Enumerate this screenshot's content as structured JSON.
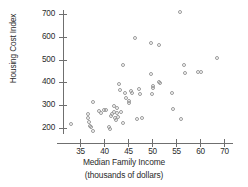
{
  "chart_data": {
    "type": "scatter",
    "title": "",
    "xlabel": "Median Family Income",
    "xlabel_sub": "(thousands of dollars)",
    "ylabel": "Housing Cost Index",
    "xlim": [
      32,
      72
    ],
    "ylim": [
      160,
      730
    ],
    "grid": false,
    "legend": null,
    "marker": "open-circle",
    "marker_color": "#9a9a9a",
    "xticks": [
      35,
      40,
      45,
      50,
      55,
      60,
      70
    ],
    "xtick_labels": [
      "35",
      "40",
      "45",
      "50",
      "55",
      "60",
      "70"
    ],
    "yticks": [
      200,
      300,
      400,
      500,
      600,
      700
    ],
    "ytick_labels": [
      "200",
      "300",
      "400",
      "500",
      "600",
      "700"
    ],
    "points": [
      {
        "x": 33.2,
        "y": 218
      },
      {
        "x": 36.6,
        "y": 262
      },
      {
        "x": 36.7,
        "y": 246
      },
      {
        "x": 36.8,
        "y": 228
      },
      {
        "x": 37.0,
        "y": 207
      },
      {
        "x": 37.3,
        "y": 205
      },
      {
        "x": 37.6,
        "y": 313
      },
      {
        "x": 37.8,
        "y": 186
      },
      {
        "x": 38.9,
        "y": 276
      },
      {
        "x": 39.4,
        "y": 266
      },
      {
        "x": 39.9,
        "y": 279
      },
      {
        "x": 40.4,
        "y": 278
      },
      {
        "x": 41.1,
        "y": 203
      },
      {
        "x": 41.2,
        "y": 196
      },
      {
        "x": 41.5,
        "y": 253
      },
      {
        "x": 41.7,
        "y": 262
      },
      {
        "x": 42.0,
        "y": 296
      },
      {
        "x": 42.1,
        "y": 271
      },
      {
        "x": 42.2,
        "y": 244
      },
      {
        "x": 42.4,
        "y": 235
      },
      {
        "x": 42.6,
        "y": 288
      },
      {
        "x": 42.8,
        "y": 268
      },
      {
        "x": 43.0,
        "y": 247
      },
      {
        "x": 43.2,
        "y": 392
      },
      {
        "x": 43.4,
        "y": 365
      },
      {
        "x": 43.6,
        "y": 271
      },
      {
        "x": 43.9,
        "y": 221
      },
      {
        "x": 44.0,
        "y": 476
      },
      {
        "x": 44.3,
        "y": 355
      },
      {
        "x": 44.6,
        "y": 331
      },
      {
        "x": 45.2,
        "y": 319
      },
      {
        "x": 45.3,
        "y": 309
      },
      {
        "x": 45.6,
        "y": 363
      },
      {
        "x": 45.9,
        "y": 355
      },
      {
        "x": 46.4,
        "y": 596
      },
      {
        "x": 46.8,
        "y": 241
      },
      {
        "x": 47.2,
        "y": 369
      },
      {
        "x": 47.4,
        "y": 347
      },
      {
        "x": 47.9,
        "y": 246
      },
      {
        "x": 49.7,
        "y": 572
      },
      {
        "x": 49.8,
        "y": 438
      },
      {
        "x": 49.9,
        "y": 347
      },
      {
        "x": 50.2,
        "y": 386
      },
      {
        "x": 50.3,
        "y": 374
      },
      {
        "x": 51.4,
        "y": 564
      },
      {
        "x": 51.5,
        "y": 400
      },
      {
        "x": 51.7,
        "y": 399
      },
      {
        "x": 54.1,
        "y": 352
      },
      {
        "x": 54.4,
        "y": 284
      },
      {
        "x": 55.8,
        "y": 706
      },
      {
        "x": 56.0,
        "y": 238
      },
      {
        "x": 56.6,
        "y": 475
      },
      {
        "x": 56.9,
        "y": 439
      },
      {
        "x": 59.5,
        "y": 447
      },
      {
        "x": 60.2,
        "y": 447
      },
      {
        "x": 63.5,
        "y": 508
      }
    ]
  },
  "axes": {
    "x_axis_name": "x-axis",
    "y_axis_name": "y-axis"
  }
}
